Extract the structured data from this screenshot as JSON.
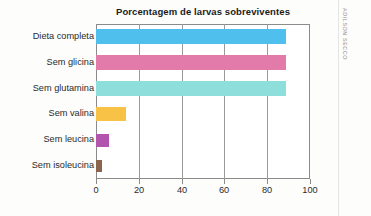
{
  "chart_data": {
    "type": "bar",
    "orientation": "horizontal",
    "title": "Porcentagem de larvas sobreviventes",
    "xlabel": "",
    "ylabel": "",
    "categories": [
      "Dieta completa",
      "Sem glicina",
      "Sem glutamina",
      "Sem valina",
      "Sem leucina",
      "Sem isoleucina"
    ],
    "values": [
      89,
      89,
      89,
      14,
      6,
      3
    ],
    "colors": [
      "#4FC0EE",
      "#E27BA9",
      "#8EDFDC",
      "#F8C246",
      "#B156AC",
      "#8B6450"
    ],
    "xlim": [
      0,
      100
    ],
    "xticks": [
      0,
      20,
      40,
      60,
      80,
      100
    ],
    "xtick_labels": [
      "0",
      "20",
      "40",
      "60",
      "80",
      "100"
    ],
    "grid": true,
    "grid_axis": "x",
    "legend": "none"
  },
  "credit": {
    "text": "ADILSON SECCO"
  }
}
